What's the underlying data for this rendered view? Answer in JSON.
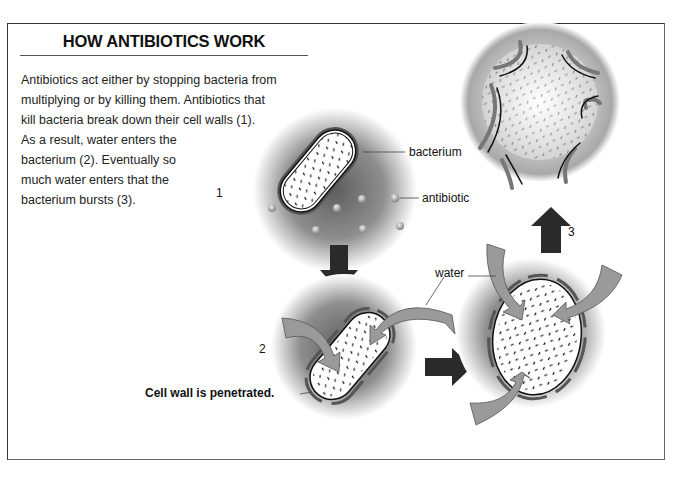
{
  "title": "HOW ANTIBIOTICS WORK",
  "paragraph": {
    "lines": [
      "Antibiotics act either by stopping bacteria from",
      "multiplying or by killing them. Antibiotics that",
      "kill bacteria break down their cell walls (1).",
      "As a result, water enters the",
      "bacterium (2). Eventually so",
      "much water enters that the",
      "bacterium bursts (3)."
    ]
  },
  "stages": {
    "one": "1",
    "two": "2",
    "three": "3"
  },
  "labels": {
    "bacterium": "bacterium",
    "antibiotic": "antibiotic",
    "water": "water",
    "cell_wall": "Cell wall is penetrated."
  },
  "colors": {
    "arrow_dark": "#2a2a2a",
    "water_arrow": "#9a9a9a",
    "halo": "#8c8c8c",
    "cell_wall": "#555555"
  }
}
